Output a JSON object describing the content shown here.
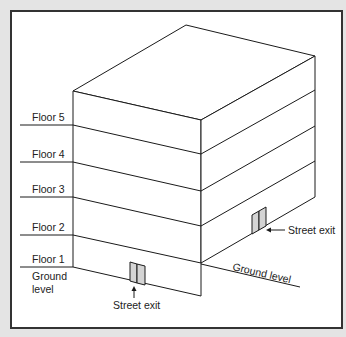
{
  "diagram": {
    "type": "isometric-building-floors",
    "colors": {
      "background": "#e4e4e4",
      "panel": "#ffffff",
      "border": "#333333",
      "line": "#1a1a1a",
      "door_fill": "#d4d4d4"
    },
    "floor_labels": [
      {
        "label": "Floor 5"
      },
      {
        "label": "Floor 4"
      },
      {
        "label": "Floor 3"
      },
      {
        "label": "Floor 2"
      },
      {
        "label": "Floor 1"
      }
    ],
    "ground_label_left_line1": "Ground",
    "ground_label_left_line2": "level",
    "ground_label_right": "Ground level",
    "street_exit_front": "Street exit",
    "street_exit_side": "Street exit"
  }
}
